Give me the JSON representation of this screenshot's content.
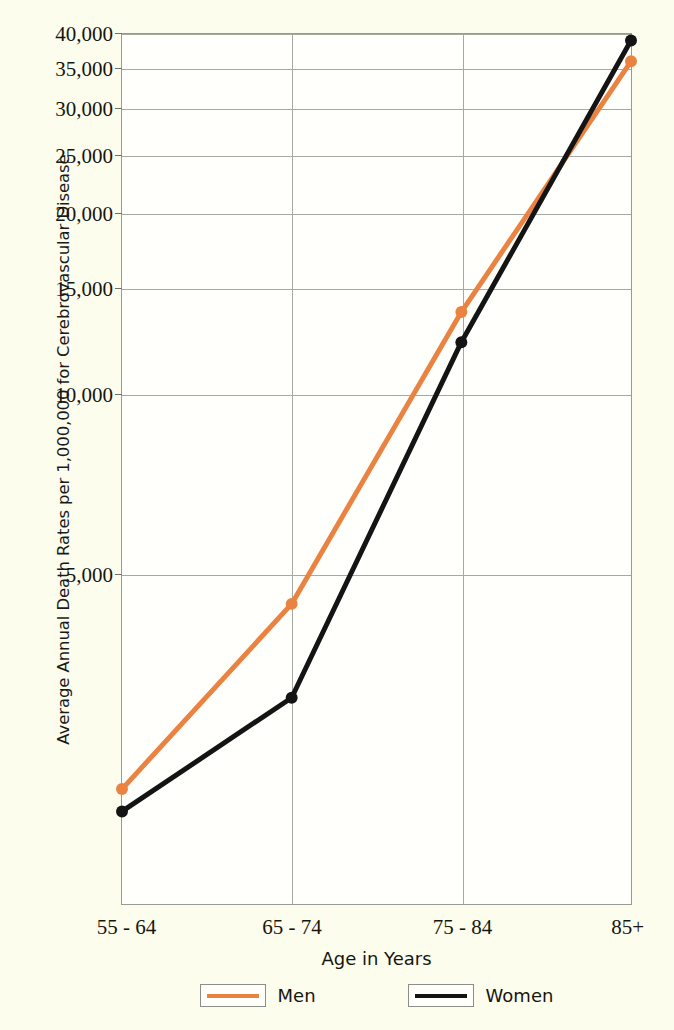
{
  "chart_data": {
    "type": "line",
    "title": "",
    "xlabel": "Age in Years",
    "ylabel": "Average Annual Death Rates per 1,000,000 for Cerebrovascular Disease",
    "categories": [
      "55 - 64",
      "65 - 74",
      "75 - 84",
      "85+"
    ],
    "series": [
      {
        "name": "Men",
        "color": "#ea8342",
        "values": [
          2180,
          4450,
          13700,
          36000
        ]
      },
      {
        "name": "Women",
        "color": "#141414",
        "values": [
          2000,
          3100,
          12200,
          39000
        ]
      }
    ],
    "yscale": "log",
    "ylim": [
      1400,
      40000
    ],
    "yticks": [
      5000,
      10000,
      15000,
      20000,
      25000,
      30000,
      35000,
      40000
    ],
    "ytick_labels": [
      "5,000",
      "10,000",
      "15,000",
      "20,000",
      "25,000",
      "30,000",
      "35,000",
      "40,000"
    ],
    "grid": true,
    "legend_position": "below"
  },
  "legend": {
    "entries": [
      {
        "label": "Men",
        "color": "#ea8342"
      },
      {
        "label": "Women",
        "color": "#141414"
      }
    ]
  },
  "colors": {
    "background": "#fdfdee",
    "plot_background": "#fffffb",
    "men": "#ea8342",
    "women": "#141414",
    "grid": "#a8a8a2",
    "frame": "#9a9a93"
  }
}
